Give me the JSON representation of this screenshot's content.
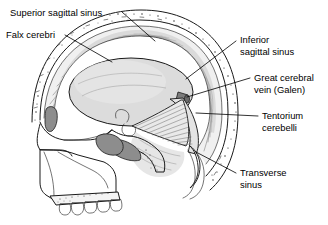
{
  "figure": {
    "background_color": "#ffffff",
    "text_color": "#000000",
    "view": "midsagittal"
  },
  "labels": [
    {
      "id": "superior-sagittal-sinus",
      "text": "Superior sagittal sinus",
      "lines": [
        "Superior sagittal sinus"
      ],
      "text_x": 10,
      "text_y": 16,
      "anchor": "start",
      "leader": "M 122,12 L 155,41"
    },
    {
      "id": "falx-cerebri",
      "text": "Falx cerebri",
      "lines": [
        "Falx cerebri"
      ],
      "text_x": 6,
      "text_y": 38,
      "anchor": "start",
      "leader": "M 65,35 L 112,62"
    },
    {
      "id": "inferior-sagittal-sinus",
      "text": "Inferior sagittal sinus",
      "lines": [
        "Inferior",
        "sagittal sinus"
      ],
      "text_x": 240,
      "text_y": 43,
      "anchor": "start",
      "leader": "M 236,41 L 186,79"
    },
    {
      "id": "great-cerebral-vein",
      "text": "Great cerebral vein (Galen)",
      "lines": [
        "Great cerebral",
        "vein (Galen)"
      ],
      "text_x": 254,
      "text_y": 81,
      "anchor": "start",
      "leader": "M 250,78 L 187,97"
    },
    {
      "id": "tentorium-cerebelli",
      "text": "Tentorium cerebelli",
      "lines": [
        "Tentorium",
        "cerebelli"
      ],
      "text_x": 262,
      "text_y": 119,
      "anchor": "start",
      "leader": "M 258,116 L 196,113"
    },
    {
      "id": "transverse-sinus",
      "text": "Transverse sinus",
      "lines": [
        "Transverse",
        "sinus"
      ],
      "text_x": 240,
      "text_y": 176,
      "anchor": "start",
      "leader": "M 236,173 L 196,152"
    }
  ],
  "structures": [
    {
      "id": "cranial-vault",
      "name": "Cranial vault (outer and inner tables)",
      "fill": "#ffffff"
    },
    {
      "id": "diploe",
      "name": "Diploe (stippled marrow space)",
      "fill": "#ffffff"
    },
    {
      "id": "brain",
      "name": "Cerebrum",
      "fill": "#dcdcdc"
    },
    {
      "id": "falx-membrane",
      "name": "Falx cerebri membrane",
      "fill": "#eeeeee"
    },
    {
      "id": "tentorium-membrane",
      "name": "Tentorium cerebelli membrane",
      "fill": "#e6e6e6"
    },
    {
      "id": "cerebellum",
      "name": "Cerebellum",
      "fill": "#e2e2e2"
    },
    {
      "id": "great-cerebral-vein-body",
      "name": "Great cerebral vein of Galen",
      "fill": "#7a7a7a"
    },
    {
      "id": "frontal-sinus",
      "name": "Frontal sinus",
      "fill": "#8a8a8a"
    },
    {
      "id": "sphenoid-sinus",
      "name": "Sphenoid sinus",
      "fill": "#8a8a8a"
    },
    {
      "id": "hard-palate",
      "name": "Hard palate",
      "fill": "#f2f2f2"
    },
    {
      "id": "maxillary-teeth",
      "name": "Maxillary teeth",
      "fill": "#ffffff",
      "count": 5
    },
    {
      "id": "transverse-sinus-lumen",
      "name": "Transverse sinus lumen",
      "fill": "#ffffff"
    }
  ]
}
